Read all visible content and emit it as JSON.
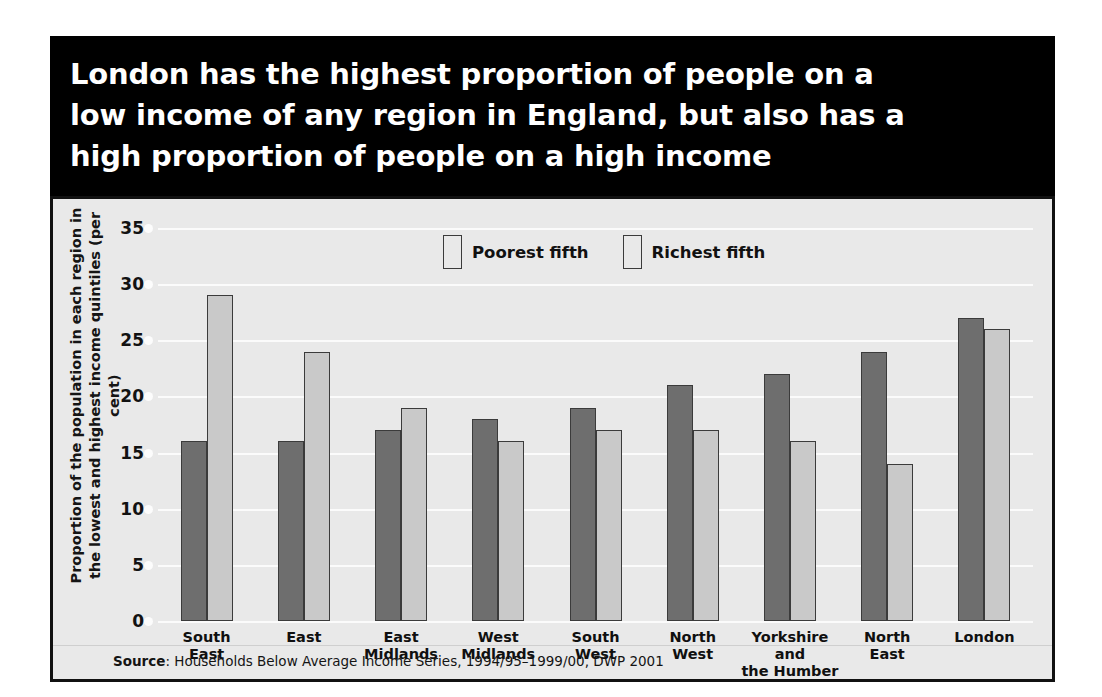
{
  "title": "London has the highest proportion of people on a\nlow income of any region in England, but also has a\nhigh proportion of people on a high income",
  "source": {
    "label": "Source",
    "separator": ": ",
    "text": "Households Below Average Income Series, 1994/95–1999/00, DWP 2001"
  },
  "colors": {
    "title_band": "#000000",
    "panel_background": "#e9e9e9",
    "poorest": "#6e6e6e",
    "richest": "#c9c9c9",
    "gridline": "#fbfbfb",
    "border": "#111111"
  },
  "chart_data": {
    "type": "bar",
    "title": "London has the highest proportion of people on a low income of any region in England, but also has a high proportion of people on a high income",
    "xlabel": "",
    "ylabel": "Proportion of the population in each region in\nthe lowest and highest income quintiles (per cent)",
    "ylim": [
      0,
      35
    ],
    "ytick_values": [
      0,
      5,
      10,
      15,
      20,
      25,
      30,
      35
    ],
    "ytick_labels": [
      "0",
      "5",
      "10",
      "15",
      "20",
      "25",
      "30",
      "35"
    ],
    "grid": true,
    "legend_position": "top-center",
    "categories": [
      "South\nEast",
      "East",
      "East\nMidlands",
      "West\nMidlands",
      "South\nWest",
      "North\nWest",
      "Yorkshire\nand\nthe Humber",
      "North\nEast",
      "London"
    ],
    "series": [
      {
        "name": "Poorest fifth",
        "color": "#6e6e6e",
        "values": [
          16,
          16,
          17,
          18,
          19,
          21,
          22,
          24,
          27
        ]
      },
      {
        "name": "Richest fifth",
        "color": "#c9c9c9",
        "values": [
          29,
          24,
          19,
          16,
          17,
          17,
          16,
          14,
          26
        ]
      }
    ]
  }
}
